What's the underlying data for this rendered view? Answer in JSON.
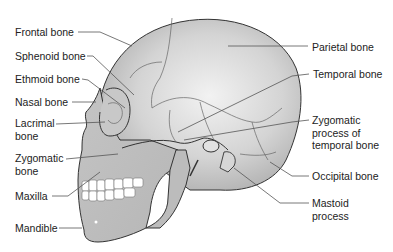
{
  "diagram": {
    "labels_left": [
      {
        "id": "frontal",
        "text": "Frontal bone",
        "x": 15,
        "y": 27
      },
      {
        "id": "sphenoid",
        "text": "Sphenoid bone",
        "x": 15,
        "y": 51
      },
      {
        "id": "ethmoid",
        "text": "Ethmoid bone",
        "x": 15,
        "y": 74
      },
      {
        "id": "nasal",
        "text": "Nasal bone",
        "x": 15,
        "y": 97
      },
      {
        "id": "lacrimal",
        "text": "Lacrimal\nbone",
        "x": 15,
        "y": 118
      },
      {
        "id": "zygomatic",
        "text": "Zygomatic\nbone",
        "x": 15,
        "y": 152
      },
      {
        "id": "maxilla",
        "text": "Maxilla",
        "x": 15,
        "y": 191
      },
      {
        "id": "mandible",
        "text": "Mandible",
        "x": 15,
        "y": 222
      }
    ],
    "labels_right": [
      {
        "id": "parietal",
        "text": "Parietal bone",
        "x": 312,
        "y": 42
      },
      {
        "id": "temporal",
        "text": "Temporal bone",
        "x": 313,
        "y": 69
      },
      {
        "id": "zygomatic_process",
        "text": "Zygomatic\nprocess of\ntemporal bone",
        "x": 312,
        "y": 116
      },
      {
        "id": "occipital",
        "text": "Occipital bone",
        "x": 312,
        "y": 171
      },
      {
        "id": "mastoid",
        "text": "Mastoid\nprocess",
        "x": 312,
        "y": 198
      }
    ],
    "colors": {
      "bone_fill_light": "#e8e8e8",
      "bone_fill_dark": "#b8b8b8",
      "outline": "#333333",
      "suture": "#666666",
      "leader_line": "#555555",
      "teeth": "#ffffff",
      "text": "#222222"
    }
  }
}
